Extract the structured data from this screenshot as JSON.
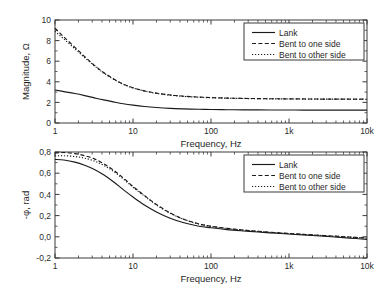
{
  "figure": {
    "width": 389,
    "height": 301,
    "background": "#ffffff",
    "line_color": "#1a1a1a",
    "axis_color": "#3a3a3a"
  },
  "chart_data": [
    {
      "id": "magnitude-plot",
      "type": "line",
      "title": "",
      "xlabel": "Frequency, Hz",
      "ylabel": "Magnitude, Ω",
      "xscale": "log",
      "xlim": [
        1,
        10000
      ],
      "ylim": [
        0,
        10
      ],
      "xticks": [
        1,
        10,
        100,
        1000,
        10000
      ],
      "xticklabels": [
        "1",
        "10",
        "100",
        "1k",
        "10k"
      ],
      "yticks": [
        0,
        2,
        4,
        6,
        8,
        10
      ],
      "yticklabels": [
        "0",
        "2",
        "4",
        "6",
        "8",
        "10"
      ],
      "grid": false,
      "legend_position": "upper right",
      "series": [
        {
          "name": "Lank",
          "style": "solid",
          "x": [
            1,
            1.3,
            1.8,
            2.4,
            3.2,
            4.2,
            5.6,
            7.5,
            10,
            14,
            20,
            30,
            45,
            70,
            100,
            160,
            260,
            400,
            700,
            1200,
            2000,
            3500,
            6000,
            10000
          ],
          "y": [
            3.2,
            3.05,
            2.86,
            2.66,
            2.44,
            2.24,
            2.05,
            1.87,
            1.73,
            1.6,
            1.5,
            1.42,
            1.37,
            1.33,
            1.31,
            1.29,
            1.28,
            1.27,
            1.26,
            1.26,
            1.25,
            1.25,
            1.25,
            1.25
          ]
        },
        {
          "name": "Bent to one side",
          "style": "dashed",
          "x": [
            1,
            1.3,
            1.8,
            2.4,
            3.2,
            4.2,
            5.6,
            7.5,
            10,
            14,
            20,
            30,
            45,
            70,
            100,
            160,
            260,
            400,
            700,
            1200,
            2000,
            3500,
            6000,
            10000
          ],
          "y": [
            9.2,
            8.35,
            7.35,
            6.45,
            5.6,
            4.9,
            4.3,
            3.78,
            3.42,
            3.12,
            2.9,
            2.72,
            2.6,
            2.52,
            2.47,
            2.42,
            2.39,
            2.37,
            2.35,
            2.34,
            2.33,
            2.32,
            2.32,
            2.31
          ]
        },
        {
          "name": "Bent to other side",
          "style": "dotted",
          "x": [
            1,
            1.3,
            1.8,
            2.4,
            3.2,
            4.2,
            5.6,
            7.5,
            10,
            14,
            20,
            30,
            45,
            70,
            100,
            160,
            260,
            400,
            700,
            1200,
            2000,
            3500,
            6000,
            10000
          ],
          "y": [
            8.9,
            8.15,
            7.2,
            6.35,
            5.55,
            4.85,
            4.26,
            3.76,
            3.4,
            3.1,
            2.88,
            2.7,
            2.58,
            2.5,
            2.45,
            2.41,
            2.38,
            2.36,
            2.34,
            2.33,
            2.32,
            2.32,
            2.31,
            2.31
          ]
        }
      ]
    },
    {
      "id": "phase-plot",
      "type": "line",
      "title": "",
      "xlabel": "Frequency, Hz",
      "ylabel": "-φ, rad",
      "xscale": "log",
      "xlim": [
        1,
        10000
      ],
      "ylim": [
        -0.2,
        0.8
      ],
      "xticks": [
        1,
        10,
        100,
        1000,
        10000
      ],
      "xticklabels": [
        "1",
        "10",
        "100",
        "1k",
        "10k"
      ],
      "yticks": [
        -0.2,
        0.0,
        0.2,
        0.4,
        0.6,
        0.8
      ],
      "yticklabels": [
        "-0,2",
        "0,0",
        "0,2",
        "0,4",
        "0,6",
        "0,8"
      ],
      "grid": false,
      "legend_position": "upper right",
      "series": [
        {
          "name": "Lank",
          "style": "solid",
          "x": [
            1,
            1.3,
            1.8,
            2.4,
            3.2,
            4.2,
            5.6,
            7.5,
            10,
            14,
            20,
            30,
            45,
            70,
            100,
            160,
            260,
            400,
            700,
            1200,
            2000,
            3500,
            6000,
            10000
          ],
          "y": [
            0.73,
            0.725,
            0.705,
            0.675,
            0.635,
            0.585,
            0.52,
            0.445,
            0.375,
            0.3,
            0.235,
            0.175,
            0.132,
            0.1,
            0.085,
            0.068,
            0.055,
            0.045,
            0.033,
            0.022,
            0.012,
            0.0,
            -0.012,
            -0.025
          ]
        },
        {
          "name": "Bent to one side",
          "style": "dashed",
          "x": [
            1,
            1.3,
            1.8,
            2.4,
            3.2,
            4.2,
            5.6,
            7.5,
            10,
            14,
            20,
            30,
            45,
            70,
            100,
            160,
            260,
            400,
            700,
            1200,
            2000,
            3500,
            6000,
            10000
          ],
          "y": [
            0.79,
            0.795,
            0.785,
            0.765,
            0.735,
            0.69,
            0.63,
            0.555,
            0.475,
            0.39,
            0.305,
            0.225,
            0.165,
            0.122,
            0.1,
            0.08,
            0.064,
            0.052,
            0.039,
            0.028,
            0.018,
            0.008,
            -0.002,
            -0.012
          ]
        },
        {
          "name": "Bent to other side",
          "style": "dotted",
          "x": [
            1,
            1.3,
            1.8,
            2.4,
            3.2,
            4.2,
            5.6,
            7.5,
            10,
            14,
            20,
            30,
            45,
            70,
            100,
            160,
            260,
            400,
            700,
            1200,
            2000,
            3500,
            6000,
            10000
          ],
          "y": [
            0.762,
            0.765,
            0.757,
            0.742,
            0.715,
            0.675,
            0.618,
            0.545,
            0.468,
            0.385,
            0.3,
            0.222,
            0.163,
            0.12,
            0.098,
            0.078,
            0.063,
            0.051,
            0.038,
            0.027,
            0.017,
            0.007,
            -0.003,
            -0.013
          ]
        }
      ]
    }
  ],
  "legend": {
    "items": [
      {
        "label": "Lank",
        "style": "solid"
      },
      {
        "label": "Bent to one side",
        "style": "dashed"
      },
      {
        "label": "Bent to other side",
        "style": "dotted"
      }
    ]
  }
}
